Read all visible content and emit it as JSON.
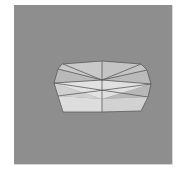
{
  "viewport": {
    "background": "#8e8e8e",
    "object": "low-poly-mesh",
    "edge_color": "#5a5a5a",
    "faces": [
      {
        "name": "top-left-upper",
        "points": "62,64 102,61 102,80 58,69",
        "fill": "#c9c9c9"
      },
      {
        "name": "top-right-upper",
        "points": "102,61 141,64 147,70 102,80",
        "fill": "#c4c4c4"
      },
      {
        "name": "left-upper",
        "points": "58,69 102,80 54,83",
        "fill": "#b9b9b9"
      },
      {
        "name": "right-upper",
        "points": "147,70 151,84 102,80",
        "fill": "#bababa"
      },
      {
        "name": "mid-left",
        "points": "54,83 102,80 102,99",
        "fill": "#e2e2e2"
      },
      {
        "name": "mid-right",
        "points": "102,80 151,84 102,99",
        "fill": "#e0e0e0"
      },
      {
        "name": "lower-left-outer",
        "points": "54,83 102,99 58,96",
        "fill": "#d0d0d0"
      },
      {
        "name": "lower-right-outer",
        "points": "151,84 148,97 102,99",
        "fill": "#b8b8b8"
      },
      {
        "name": "bottom-left",
        "points": "58,96 102,99 102,112 63,112",
        "fill": "#dddddd"
      },
      {
        "name": "bottom-right",
        "points": "102,99 148,97 141,111 102,112",
        "fill": "#d2d2d2"
      }
    ],
    "edges": [
      "62,64 102,61",
      "102,61 141,64",
      "141,64 147,70",
      "147,70 151,84",
      "151,84 148,97",
      "148,97 141,111",
      "141,111 102,112",
      "102,112 63,112",
      "63,112 58,96",
      "58,96 54,83",
      "54,83 58,69",
      "58,69 62,64",
      "102,61 102,112",
      "58,69 102,80",
      "102,80 147,70",
      "54,83 102,80",
      "102,80 151,84",
      "54,83 148,97",
      "151,84 58,96",
      "63,64 102,80",
      "141,64 102,80"
    ]
  }
}
